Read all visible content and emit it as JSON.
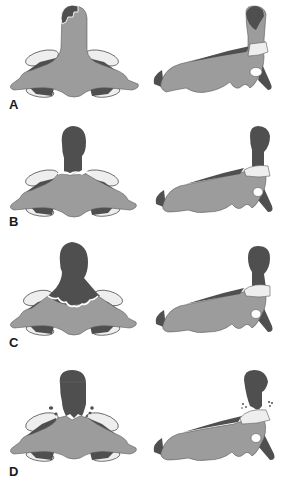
{
  "figure": {
    "colors": {
      "bone_light": "#9c9c9c",
      "bone_dark": "#4f4f4f",
      "cartilage": "#eeeeee",
      "outline": "#5a5a5a",
      "background": "#ffffff",
      "label": "#1a1a1a"
    },
    "panels": [
      {
        "label": "A",
        "front_view": "front-view",
        "side_view": "side-view"
      },
      {
        "label": "B",
        "front_view": "front-view",
        "side_view": "side-view"
      },
      {
        "label": "C",
        "front_view": "front-view",
        "side_view": "side-view"
      },
      {
        "label": "D",
        "front_view": "front-view",
        "side_view": "side-view"
      }
    ]
  }
}
